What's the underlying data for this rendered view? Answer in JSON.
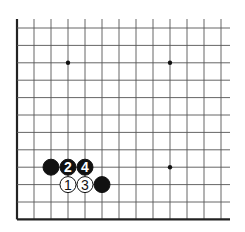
{
  "diagram": {
    "type": "go-board-fragment",
    "grid": {
      "columns": 13,
      "rows": 12,
      "origin_x": 17,
      "origin_y": 28,
      "spacing_x": 17,
      "spacing_y": 17.4,
      "line_color": "#555555",
      "edge_color": "#222222",
      "edges": {
        "left": true,
        "bottom": true,
        "top": false,
        "right": false
      },
      "overhang_top": 9,
      "overhang_right": 9
    },
    "star_points": [
      {
        "col": 3,
        "row": 2
      },
      {
        "col": 9,
        "row": 2
      },
      {
        "col": 9,
        "row": 8
      }
    ],
    "stones": [
      {
        "col": 2,
        "row": 8,
        "color": "black",
        "label": ""
      },
      {
        "col": 3,
        "row": 8,
        "color": "black",
        "label": "2"
      },
      {
        "col": 4,
        "row": 8,
        "color": "black",
        "label": "4"
      },
      {
        "col": 3,
        "row": 9,
        "color": "white",
        "label": "1"
      },
      {
        "col": 4,
        "row": 9,
        "color": "white",
        "label": "3"
      },
      {
        "col": 5,
        "row": 9,
        "color": "black",
        "label": ""
      }
    ],
    "colors": {
      "black_stone": "#111111",
      "white_stone": "#ffffff",
      "stone_outline": "#111111"
    },
    "stone_radius": 8.5
  }
}
